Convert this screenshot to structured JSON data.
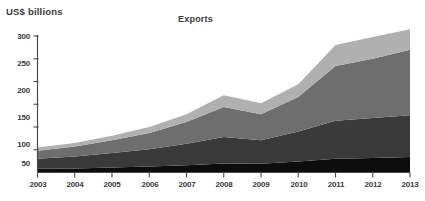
{
  "axis_unit_label": "US$ billions",
  "title": "Exports",
  "chart_data": {
    "type": "area",
    "title": "Exports",
    "xlabel": "",
    "ylabel": "US$ billions",
    "ylim": [
      0,
      300
    ],
    "yticks": [
      50,
      100,
      150,
      200,
      250,
      300
    ],
    "grid": false,
    "legend": "none",
    "stacked": true,
    "categories": [
      "2003",
      "2004",
      "2005",
      "2006",
      "2007",
      "2008",
      "2009",
      "2010",
      "2011",
      "2012",
      "2013"
    ],
    "series": [
      {
        "name": "series-1",
        "color": "#0d0d0d",
        "values": [
          8,
          9,
          11,
          13,
          16,
          20,
          19,
          24,
          30,
          32,
          34
        ]
      },
      {
        "name": "series-2",
        "color": "#3a3a3a",
        "values": [
          22,
          26,
          32,
          38,
          47,
          58,
          52,
          66,
          84,
          88,
          92
        ]
      },
      {
        "name": "series-3",
        "color": "#6e6e6e",
        "values": [
          18,
          22,
          28,
          36,
          48,
          66,
          57,
          76,
          120,
          130,
          144
        ]
      },
      {
        "name": "series-4",
        "color": "#b0b0b0",
        "values": [
          7,
          8,
          10,
          13,
          17,
          26,
          24,
          28,
          46,
          48,
          45
        ]
      }
    ],
    "totals": [
      55,
      65,
      81,
      100,
      128,
      170,
      152,
      194,
      280,
      298,
      315
    ]
  },
  "yticks": {
    "t300": "300",
    "t250": "250",
    "t200": "200",
    "t150": "150",
    "t100": "100",
    "t50": "50"
  },
  "xticks": {
    "y2003": "2003",
    "y2004": "2004",
    "y2005": "2005",
    "y2006": "2006",
    "y2007": "2007",
    "y2008": "2008",
    "y2009": "2009",
    "y2010": "2010",
    "y2011": "2011",
    "y2012": "2012",
    "y2013": "2013"
  }
}
